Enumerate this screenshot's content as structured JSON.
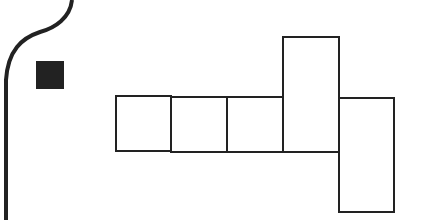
{
  "diagram": {
    "type": "cube-net",
    "stroke_color": "#222222",
    "fill_color": "#ffffff",
    "border_curve": {
      "description": "page-edge curve on left side"
    },
    "marker": {
      "shape": "filled-square",
      "color": "#222222",
      "x": 36,
      "y": 61,
      "size": 28
    },
    "faces": [
      {
        "id": "face-1",
        "x": 116,
        "y": 96,
        "w": 55,
        "h": 55
      },
      {
        "id": "face-2",
        "x": 171,
        "y": 97,
        "w": 56,
        "h": 55
      },
      {
        "id": "face-3",
        "x": 227,
        "y": 97,
        "w": 56,
        "h": 55
      },
      {
        "id": "face-4",
        "x": 283,
        "y": 37,
        "w": 56,
        "h": 115
      },
      {
        "id": "face-5",
        "x": 339,
        "y": 98,
        "w": 55,
        "h": 114
      }
    ]
  }
}
